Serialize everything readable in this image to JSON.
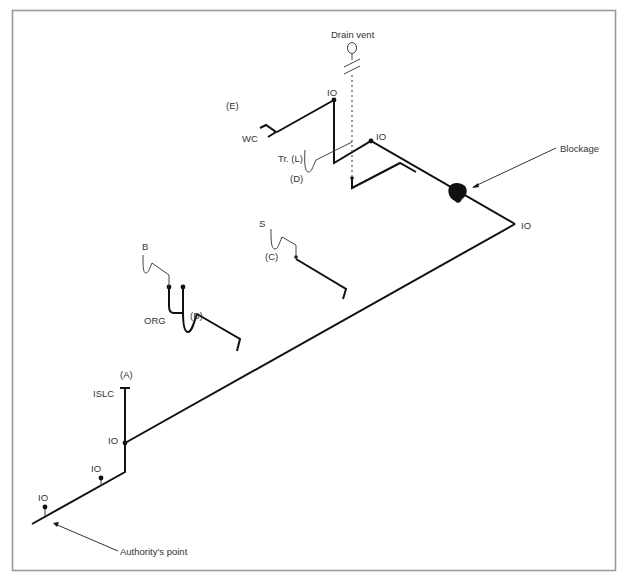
{
  "diagram": {
    "labels": {
      "drain_vent": "Drain vent",
      "io_top": "IO",
      "io_upper_right": "IO",
      "io_far_right": "IO",
      "io_main": "IO",
      "io_mid_low": "IO",
      "io_lowest": "IO",
      "e": "(E)",
      "wc": "WC",
      "trap_l": "Tr. (L)",
      "d": "(D)",
      "blockage": "Blockage",
      "s": "S",
      "c": "(C)",
      "b_fixture": "B",
      "org": "ORG",
      "b": "(B)",
      "a": "(A)",
      "islc": "ISLC",
      "authority_point": "Authority's point"
    },
    "legend_abbreviations": [
      "IO",
      "WC",
      "S",
      "B",
      "ORG",
      "ISLC",
      "Tr. (L)"
    ],
    "branches": [
      {
        "id": "A",
        "fixture": "ISLC"
      },
      {
        "id": "B",
        "fixture": "B / ORG"
      },
      {
        "id": "C",
        "fixture": "S"
      },
      {
        "id": "D",
        "fixture": "Tr. (L)"
      },
      {
        "id": "E",
        "fixture": "WC"
      }
    ],
    "colors": {
      "pipe": "#111111",
      "frame": "#9a9a9a",
      "text": "#333333",
      "background": "#ffffff"
    }
  }
}
